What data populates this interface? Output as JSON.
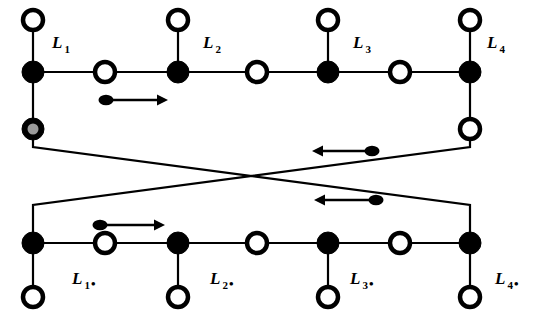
{
  "figure": {
    "background_color": "#ffffff",
    "line_color": "#000000",
    "node_fill_black": "#000000",
    "node_fill_white": "#ffffff",
    "node_fill_gray": "#9a9a9a"
  },
  "labels": {
    "top": [
      {
        "base": "L",
        "sub": "1",
        "dot": "",
        "x": 52,
        "y": 48
      },
      {
        "base": "L",
        "sub": "2",
        "dot": "",
        "x": 203,
        "y": 48
      },
      {
        "base": "L",
        "sub": "3",
        "dot": "",
        "x": 353,
        "y": 48
      },
      {
        "base": "L",
        "sub": "4",
        "dot": "",
        "x": 487,
        "y": 48
      }
    ],
    "bottom": [
      {
        "base": "L",
        "sub": "1",
        "dot": "•",
        "x": 72,
        "y": 284
      },
      {
        "base": "L",
        "sub": "2",
        "dot": "•",
        "x": 210,
        "y": 284
      },
      {
        "base": "L",
        "sub": "3",
        "dot": "•",
        "x": 350,
        "y": 284
      },
      {
        "base": "L",
        "sub": "4",
        "dot": "•",
        "x": 495,
        "y": 284
      }
    ]
  },
  "top_chain": {
    "y": 72,
    "nodes": [
      {
        "x": 33,
        "type": "black"
      },
      {
        "x": 105,
        "type": "white"
      },
      {
        "x": 178,
        "type": "black"
      },
      {
        "x": 257,
        "type": "white"
      },
      {
        "x": 328,
        "type": "black"
      },
      {
        "x": 400,
        "type": "white"
      },
      {
        "x": 470,
        "type": "black"
      }
    ],
    "stems_up": [
      {
        "x": 33,
        "y_node": 20
      },
      {
        "x": 178,
        "y_node": 20
      },
      {
        "x": 328,
        "y_node": 20
      },
      {
        "x": 470,
        "y_node": 20
      }
    ],
    "stem_nodes_up": [
      {
        "x": 33,
        "y": 20,
        "type": "white"
      },
      {
        "x": 178,
        "y": 20,
        "type": "white"
      },
      {
        "x": 328,
        "y": 20,
        "type": "white"
      },
      {
        "x": 470,
        "y": 20,
        "type": "white"
      }
    ],
    "stems_down": [
      {
        "x": 33,
        "y_node": 129,
        "type": "gray"
      },
      {
        "x": 470,
        "y_node": 129,
        "type": "white"
      }
    ]
  },
  "bottom_chain": {
    "y": 243,
    "nodes": [
      {
        "x": 33,
        "type": "black"
      },
      {
        "x": 105,
        "type": "white"
      },
      {
        "x": 178,
        "type": "black"
      },
      {
        "x": 257,
        "type": "white"
      },
      {
        "x": 328,
        "type": "black"
      },
      {
        "x": 400,
        "type": "white"
      },
      {
        "x": 470,
        "type": "black"
      }
    ],
    "stems_down": [
      {
        "x": 33,
        "y_node": 297,
        "type": "white"
      },
      {
        "x": 178,
        "y_node": 297,
        "type": "white"
      },
      {
        "x": 328,
        "y_node": 297,
        "type": "white"
      },
      {
        "x": 470,
        "y_node": 297,
        "type": "white"
      }
    ]
  },
  "crossing_links": [
    {
      "name": "left-down-to-right",
      "path": "M 33 129 L 33 147 L 470 205 L 470 243"
    },
    {
      "name": "right-down-to-left",
      "path": "M 470 129 L 470 147 L 33 205 L 33 243"
    }
  ],
  "arrows": [
    {
      "name": "arrow-top-right",
      "direction": "right",
      "blob_x": 106,
      "tip_x": 168,
      "y": 100
    },
    {
      "name": "arrow-mid-left",
      "direction": "left",
      "blob_x": 372,
      "tip_x": 312,
      "y": 151
    },
    {
      "name": "arrow-mid-left-2",
      "direction": "left",
      "blob_x": 376,
      "tip_x": 314,
      "y": 200
    },
    {
      "name": "arrow-bottom-right",
      "direction": "right",
      "blob_x": 100,
      "tip_x": 165,
      "y": 225
    }
  ],
  "geometry": {
    "node_radius_black": 11,
    "node_radius_white_outer": 10,
    "node_radius_white_inner": 5.5,
    "node_radius_gray_outer": 11,
    "node_radius_gray_inner": 5.5,
    "line_width": 2.2
  }
}
